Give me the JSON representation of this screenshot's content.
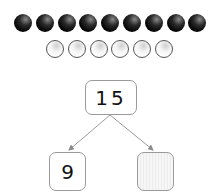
{
  "counters": {
    "black_count": 9,
    "white_count": 6,
    "black_color": "#000000",
    "white_color": "#ffffff"
  },
  "number_bond": {
    "whole": "15",
    "part_left": "9",
    "part_right": ""
  },
  "colors": {
    "box_border": "#9a9a9a",
    "arrow": "#8a8a8a",
    "blank_fill": "#f2f2f2"
  }
}
